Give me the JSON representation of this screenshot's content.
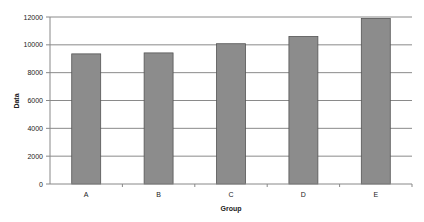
{
  "chart_data": {
    "type": "bar",
    "title": "",
    "xlabel": "Group",
    "ylabel": "Data",
    "categories": [
      "A",
      "B",
      "C",
      "D",
      "E"
    ],
    "values": [
      9350,
      9420,
      10080,
      10600,
      11900
    ],
    "ylim": [
      0,
      12000
    ],
    "yticks": [
      0,
      2000,
      4000,
      6000,
      8000,
      10000,
      12000
    ],
    "ytick_labels": [
      "0",
      "2000",
      "4000",
      "6000",
      "8000",
      "10000",
      "12000"
    ],
    "grid": true,
    "legend": "none",
    "bar_color": "#8c8c8c",
    "bar_edge_color": "#555555",
    "grid_color": "#8a8a8a"
  }
}
